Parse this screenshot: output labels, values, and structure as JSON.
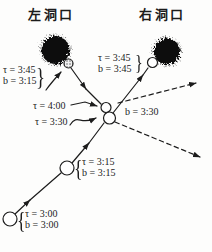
{
  "titles": {
    "left": "左洞口",
    "right": "右洞口"
  },
  "labels": {
    "left_portal": {
      "line1": "τ = 3:45",
      "line2": "b = 3:15",
      "brace": "}"
    },
    "right_portal": {
      "line1": "τ = 3:45",
      "line2": "b = 3:45",
      "brace": "}"
    },
    "junction_time_upper": "τ = 4:00",
    "junction_time_lower": "τ = 3:30",
    "junction_b": "b = 3:30",
    "mid_node": {
      "line1": "τ = 3:15",
      "line2": "b = 3:15",
      "brace": "{"
    },
    "start_node": {
      "line1": "τ = 3:00",
      "line2": "b = 3:00",
      "brace": "{"
    }
  },
  "colors": {
    "ink": "#1c1c1c",
    "blob": "#111111",
    "paper": "#fdfdfc"
  }
}
